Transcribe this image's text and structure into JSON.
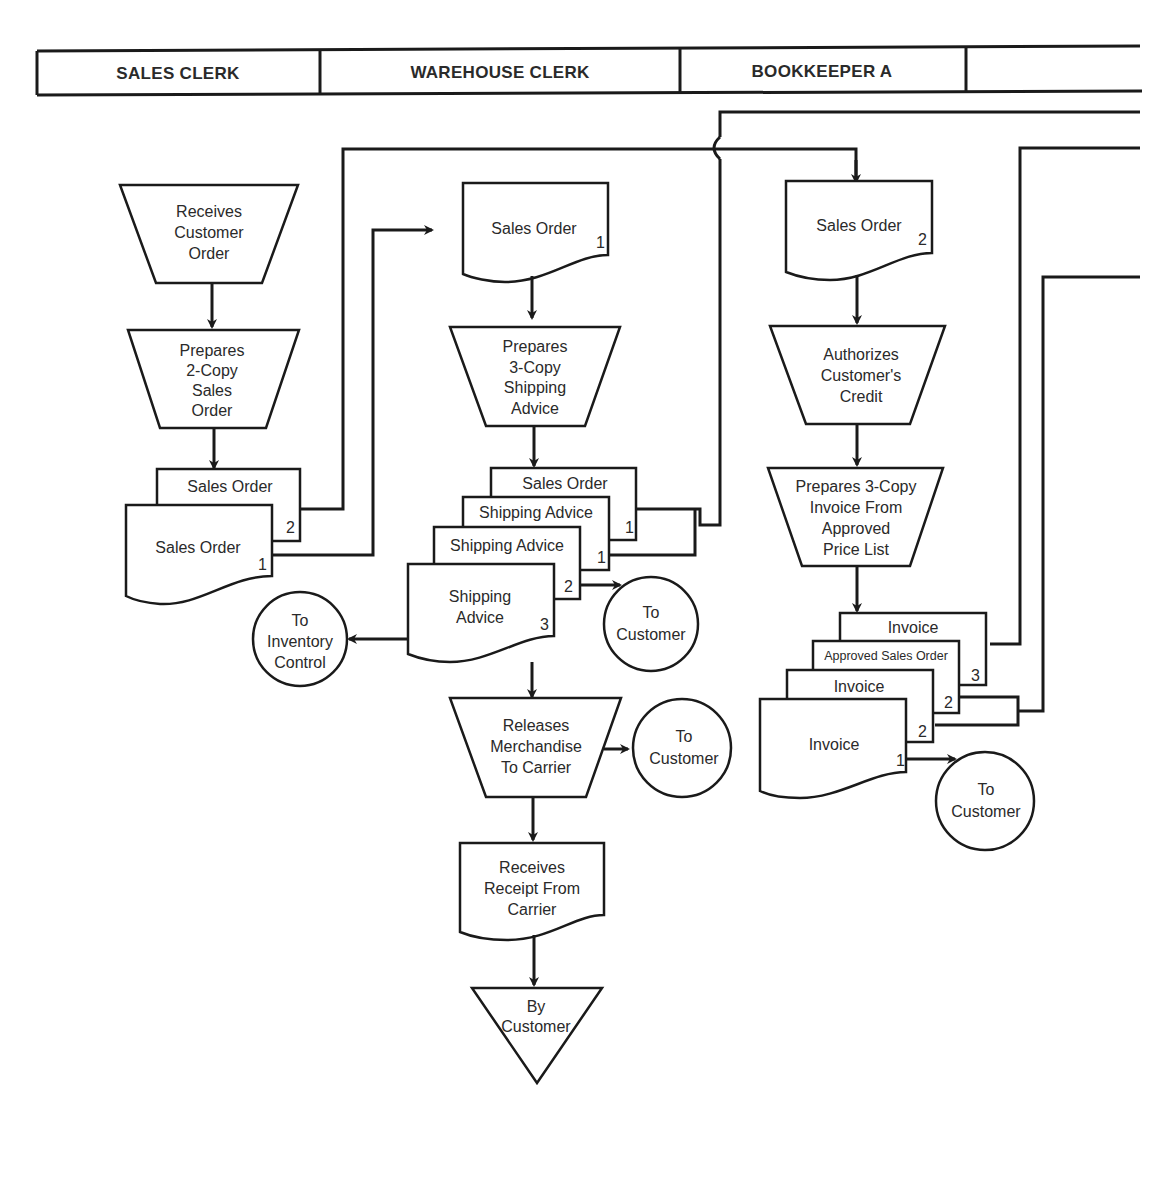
{
  "diagram": {
    "type": "flowchart",
    "style": "swimlane document flowchart",
    "colors": {
      "line": "#1a1a1a",
      "background": "#ffffff",
      "text": "#2a2a2a"
    },
    "lanes": [
      {
        "label": "SALES CLERK"
      },
      {
        "label": "WAREHOUSE CLERK"
      },
      {
        "label": "BOOKKEEPER A"
      },
      {
        "label": ""
      }
    ],
    "sales_clerk": {
      "receives_order": [
        "Receives",
        "Customer",
        "Order"
      ],
      "prepares_sales_order": [
        "Prepares",
        "2-Copy",
        "Sales",
        "Order"
      ],
      "doc_copy2": {
        "label": "Sales Order",
        "num": "2"
      },
      "doc_copy1": {
        "label": "Sales Order",
        "num": "1"
      },
      "to_inventory": [
        "To",
        "Inventory",
        "Control"
      ]
    },
    "warehouse_clerk": {
      "sales_order_in": {
        "label": "Sales Order",
        "num": "1"
      },
      "prepares_shipping": [
        "Prepares",
        "3-Copy",
        "Shipping",
        "Advice"
      ],
      "stack_sales_order": {
        "label": "Sales Order"
      },
      "stack_ship1": {
        "label": "Shipping Advice",
        "num": "1"
      },
      "stack_ship2": {
        "label": "Shipping Advice",
        "num": "1"
      },
      "stack_ship3": {
        "label": [
          "Shipping",
          "Advice"
        ],
        "num": "3",
        "num2": "2"
      },
      "to_customer_1": [
        "To",
        "Customer"
      ],
      "releases": [
        "Releases",
        "Merchandise",
        "To Carrier"
      ],
      "to_customer_2": [
        "To",
        "Customer"
      ],
      "receives_receipt": [
        "Receives",
        "Receipt From",
        "Carrier"
      ],
      "by_customer": [
        "By",
        "Customer"
      ]
    },
    "bookkeeper_a": {
      "sales_order_in": {
        "label": "Sales Order",
        "num": "2"
      },
      "authorizes": [
        "Authorizes",
        "Customer's",
        "Credit"
      ],
      "prepares_invoice": [
        "Prepares 3-Copy",
        "Invoice From",
        "Approved",
        "Price List"
      ],
      "stack_invoice_top": {
        "label": "Invoice",
        "num": "3"
      },
      "stack_approved": {
        "label": "Approved Sales Order",
        "num": "2"
      },
      "stack_invoice_mid": {
        "label": "Invoice",
        "num": "2"
      },
      "stack_invoice_front": {
        "label": "Invoice",
        "num": "1"
      },
      "to_customer": [
        "To",
        "Customer"
      ]
    }
  }
}
